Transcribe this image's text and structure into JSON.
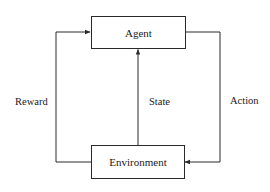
{
  "diagram": {
    "type": "reinforcement-learning-loop",
    "nodes": [
      {
        "id": "agent",
        "label": "Agent"
      },
      {
        "id": "environment",
        "label": "Environment"
      }
    ],
    "edges": [
      {
        "id": "reward",
        "from": "environment",
        "to": "agent",
        "label": "Reward",
        "side": "left"
      },
      {
        "id": "state",
        "from": "environment",
        "to": "agent",
        "label": "State",
        "side": "center"
      },
      {
        "id": "action",
        "from": "agent",
        "to": "environment",
        "label": "Action",
        "side": "right"
      }
    ],
    "colors": {
      "line": "#2a2a2a",
      "background": "#ffffff",
      "text": "#1a1a1a"
    }
  }
}
